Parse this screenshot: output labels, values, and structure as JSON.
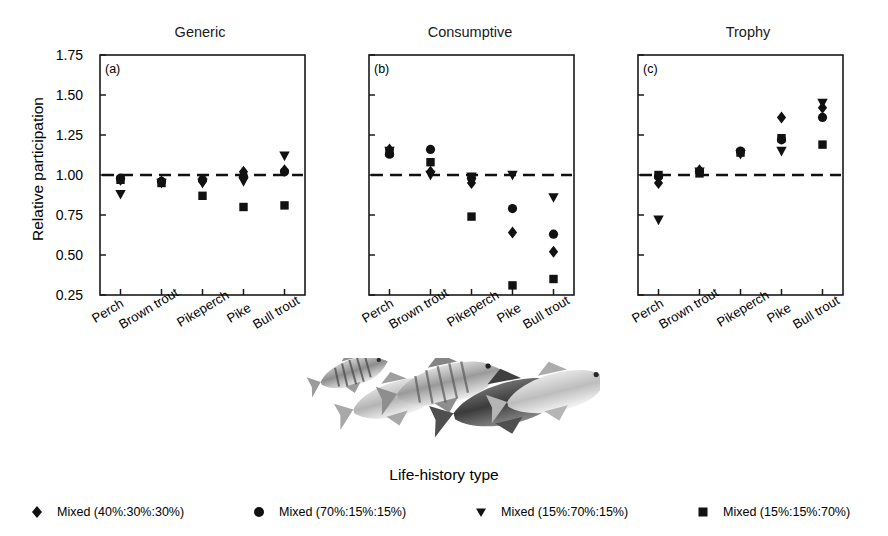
{
  "figure": {
    "axis_y_label": "Relative participation",
    "axis_x_label": "Life-history type",
    "fish_illustration_alt": "five-fish-grayscale-illustration"
  },
  "panels": [
    {
      "tag": "(a)",
      "title": "Generic"
    },
    {
      "tag": "(b)",
      "title": "Consumptive"
    },
    {
      "tag": "(c)",
      "title": "Trophy"
    }
  ],
  "legend": {
    "items": [
      {
        "marker": "diamond-marker",
        "label": "Mixed (40%:30%:30%)"
      },
      {
        "marker": "circle-marker",
        "label": "Mixed (70%:15%:15%)"
      },
      {
        "marker": "triangle-down-marker",
        "label": "Mixed (15%:70%:15%)"
      },
      {
        "marker": "square-marker",
        "label": "Mixed (15%:15%:70%)"
      }
    ]
  },
  "chart_data": {
    "type": "scatter",
    "title": "",
    "xlabel": "Life-history type",
    "ylabel": "Relative participation",
    "ylim": [
      0.25,
      1.75
    ],
    "yticks": [
      0.25,
      0.5,
      0.75,
      1.0,
      1.25,
      1.5,
      1.75
    ],
    "ytick_labels": [
      "0.25",
      "0.50",
      "0.75",
      "1.00",
      "1.25",
      "1.50",
      "1.75"
    ],
    "categories": [
      "Perch",
      "Brown trout",
      "Pikeperch",
      "Pike",
      "Bull trout"
    ],
    "grid": false,
    "reference_line": {
      "y": 1.0,
      "style": "dashed"
    },
    "legend_position": "bottom",
    "panels": [
      {
        "tag": "(a)",
        "title": "Generic",
        "series": [
          {
            "name": "Mixed (40%:30%:30%)",
            "marker": "diamond",
            "values": [
              0.97,
              0.96,
              0.96,
              1.02,
              1.03
            ]
          },
          {
            "name": "Mixed (70%:15%:15%)",
            "marker": "circle",
            "values": [
              0.98,
              0.96,
              0.97,
              0.99,
              1.02
            ]
          },
          {
            "name": "Mixed (15%:70%:15%)",
            "marker": "triangle-down",
            "values": [
              0.88,
              0.95,
              0.95,
              0.96,
              1.12
            ]
          },
          {
            "name": "Mixed (15%:15%:70%)",
            "marker": "square",
            "values": [
              0.97,
              0.95,
              0.87,
              0.8,
              0.81
            ]
          }
        ]
      },
      {
        "tag": "(b)",
        "title": "Consumptive",
        "series": [
          {
            "name": "Mixed (40%:30%:30%)",
            "marker": "diamond",
            "values": [
              1.16,
              1.02,
              0.95,
              0.64,
              0.52
            ]
          },
          {
            "name": "Mixed (70%:15%:15%)",
            "marker": "circle",
            "values": [
              1.13,
              1.16,
              0.98,
              0.79,
              0.63
            ]
          },
          {
            "name": "Mixed (15%:70%:15%)",
            "marker": "triangle-down",
            "values": [
              1.15,
              1.0,
              0.99,
              1.0,
              0.86
            ]
          },
          {
            "name": "Mixed (15%:15%:70%)",
            "marker": "square",
            "values": [
              1.14,
              1.08,
              0.74,
              0.31,
              0.35
            ]
          }
        ]
      },
      {
        "tag": "(c)",
        "title": "Trophy",
        "series": [
          {
            "name": "Mixed (40%:30%:30%)",
            "marker": "diamond",
            "values": [
              0.95,
              1.03,
              1.14,
              1.36,
              1.42
            ]
          },
          {
            "name": "Mixed (70%:15%:15%)",
            "marker": "circle",
            "values": [
              0.99,
              1.02,
              1.15,
              1.22,
              1.36
            ]
          },
          {
            "name": "Mixed (15%:70%:15%)",
            "marker": "triangle-down",
            "values": [
              0.72,
              1.02,
              1.13,
              1.15,
              1.45
            ]
          },
          {
            "name": "Mixed (15%:15%:70%)",
            "marker": "square",
            "values": [
              1.0,
              1.01,
              1.14,
              1.23,
              1.19
            ]
          }
        ]
      }
    ]
  }
}
